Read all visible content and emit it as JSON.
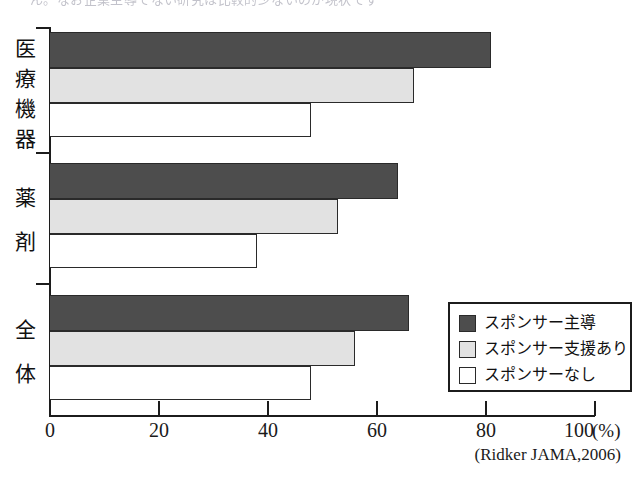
{
  "top_cut_text": "ん。なお企業主導でない研究は比較的少ないのが現状です",
  "chart_data": {
    "type": "bar",
    "orientation": "horizontal",
    "title": "",
    "xlabel": "(%)",
    "ylabel": "",
    "categories": [
      "医療機器",
      "薬剤",
      "全体"
    ],
    "xlim": [
      0,
      100
    ],
    "xticks": [
      0,
      20,
      40,
      60,
      80,
      100
    ],
    "xtick_labels": [
      "0",
      "20",
      "40",
      "60",
      "80",
      "100"
    ],
    "unit_label": "(%)",
    "grid": false,
    "legend_position": "bottom-right",
    "source": "(Ridker JAMA,2006)",
    "series": [
      {
        "name": "スポンサー主導",
        "color": "#4d4d4d",
        "values": [
          81,
          64,
          66
        ]
      },
      {
        "name": "スポンサー支援あり",
        "color": "#e2e2e2",
        "values": [
          67,
          53,
          56
        ]
      },
      {
        "name": "スポンサーなし",
        "color": "#ffffff",
        "values": [
          48,
          38,
          48
        ]
      }
    ]
  },
  "legend": {
    "items": [
      {
        "label": "スポンサー主導",
        "swatch": "led"
      },
      {
        "label": "スポンサー支援あり",
        "swatch": "supp"
      },
      {
        "label": "スポンサーなし",
        "swatch": "none"
      }
    ]
  },
  "axis": {
    "ticks": [
      "0",
      "20",
      "40",
      "60",
      "80",
      "100"
    ],
    "unit": "(%)",
    "source": "(Ridker JAMA,2006)"
  },
  "categories": [
    {
      "label": "医療機器",
      "chars": [
        "医",
        "療",
        "機",
        "器"
      ]
    },
    {
      "label": "薬剤",
      "chars": [
        "薬",
        "剤"
      ]
    },
    {
      "label": "全体",
      "chars": [
        "全",
        "体"
      ]
    }
  ]
}
